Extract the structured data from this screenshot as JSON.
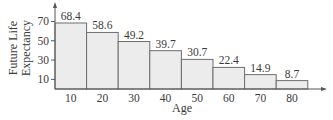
{
  "chart_data": {
    "type": "bar",
    "title": "",
    "xlabel": "Age",
    "ylabel": "Future Life Expectancy",
    "ylabel_lines": [
      "Future Life",
      "Expectancy"
    ],
    "categories": [
      "10",
      "20",
      "30",
      "40",
      "50",
      "60",
      "70",
      "80"
    ],
    "values": [
      68.4,
      58.6,
      49.2,
      39.7,
      30.7,
      22.4,
      14.9,
      8.7
    ],
    "data_labels": [
      "68.4",
      "58.6",
      "49.2",
      "39.7",
      "30.7",
      "22.4",
      "14.9",
      "8.7"
    ],
    "y_ticks": [
      10,
      30,
      50,
      70
    ],
    "ylim": [
      0,
      75
    ],
    "grid": false,
    "legend": null,
    "bar_fill": "#ececec",
    "bar_stroke": "#6e6e6e"
  }
}
